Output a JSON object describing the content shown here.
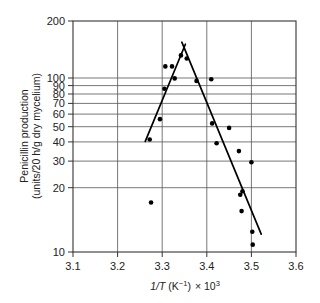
{
  "chart_data": {
    "type": "scatter",
    "title": "",
    "subtitle": "",
    "xlabel": "1/T (K⁻¹) × 10³",
    "ylabel": "Penicillin production (units/20 h/g dry mycelium)",
    "ylabel_line1": "Penicillin production",
    "ylabel_line2": "(units/20 h/g dry mycelium)",
    "xlabel_parts": {
      "variable": "1/T",
      "units": "(K",
      "unit_exponent": "−1",
      "units_close": ")",
      "times": "× 10",
      "power": "3"
    },
    "xscale": "linear",
    "yscale": "log",
    "xlim": [
      3.1,
      3.6
    ],
    "ylim": [
      10,
      200
    ],
    "grid": true,
    "grid_axes": "both",
    "legend": "none",
    "xticks": [
      3.1,
      3.2,
      3.3,
      3.4,
      3.5,
      3.6
    ],
    "xtick_labels": [
      "3.1",
      "3.2",
      "3.3",
      "3.4",
      "3.5",
      "3.6"
    ],
    "yticks": [
      10,
      20,
      30,
      40,
      50,
      60,
      70,
      80,
      90,
      100,
      200
    ],
    "ytick_labels": [
      "10",
      "20",
      "30",
      "40",
      "50",
      "60",
      "70",
      "80",
      "90",
      "100",
      "200"
    ],
    "points": [
      {
        "x": 3.272,
        "y": 43
      },
      {
        "x": 3.275,
        "y": 19
      },
      {
        "x": 3.295,
        "y": 56
      },
      {
        "x": 3.305,
        "y": 83
      },
      {
        "x": 3.307,
        "y": 111
      },
      {
        "x": 3.322,
        "y": 111
      },
      {
        "x": 3.328,
        "y": 95
      },
      {
        "x": 3.342,
        "y": 128
      },
      {
        "x": 3.355,
        "y": 123
      },
      {
        "x": 3.377,
        "y": 92
      },
      {
        "x": 3.41,
        "y": 94
      },
      {
        "x": 3.412,
        "y": 53
      },
      {
        "x": 3.422,
        "y": 41
      },
      {
        "x": 3.45,
        "y": 50
      },
      {
        "x": 3.472,
        "y": 37
      },
      {
        "x": 3.475,
        "y": 21
      },
      {
        "x": 3.48,
        "y": 22
      },
      {
        "x": 3.478,
        "y": 17
      },
      {
        "x": 3.5,
        "y": 32
      },
      {
        "x": 3.502,
        "y": 13
      },
      {
        "x": 3.503,
        "y": 11
      }
    ],
    "fit_lines": [
      {
        "name": "ascending-branch",
        "x1": 3.262,
        "y1": 42,
        "x2": 3.352,
        "y2": 148
      },
      {
        "name": "descending-branch",
        "x1": 3.344,
        "y1": 152,
        "x2": 3.522,
        "y2": 12.6
      }
    ]
  }
}
